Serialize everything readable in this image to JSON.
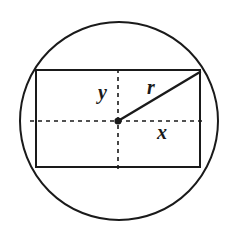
{
  "figure": {
    "background_color": "#ffffff",
    "stroke_color": "#1a1a1a",
    "labels": {
      "radius": "r",
      "half_height": "y",
      "half_width": "x"
    },
    "geometry": {
      "circle": {
        "center_x": 119,
        "center_y": 121,
        "radius": 99,
        "stroke_width": 2
      },
      "rectangle": {
        "left": 36,
        "top": 70,
        "right": 200,
        "bottom": 167,
        "width": 164,
        "height": 97,
        "stroke_width": 2
      },
      "center_dot": {
        "x": 118,
        "y": 121,
        "radius": 3.6
      },
      "radius_line": {
        "x1": 118,
        "y1": 121,
        "x2": 200,
        "y2": 72,
        "stroke_width": 2.4
      },
      "horizontal_axis": {
        "x1": 30,
        "y1": 121,
        "x2": 206,
        "y2": 121,
        "dash": "4 4",
        "stroke_width": 1.6
      },
      "vertical_axis": {
        "x1": 118,
        "y1": 69,
        "x2": 118,
        "y2": 169,
        "dash": "4 4",
        "stroke_width": 1.6
      }
    }
  }
}
